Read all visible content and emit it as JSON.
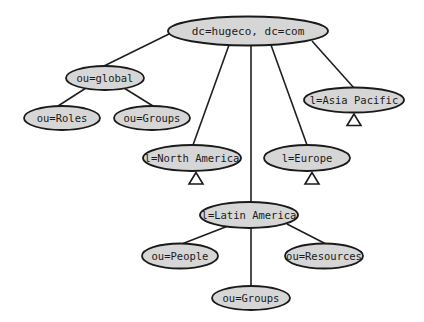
{
  "diagram": {
    "colors": {
      "node_fill": "#d6d6d6",
      "node_stroke": "#1a1a1a",
      "edge": "#1f1f1f",
      "background": "#ffffff"
    },
    "nodes": {
      "root": {
        "label": "dc=hugeco, dc=com",
        "cx": 248,
        "cy": 31,
        "rx": 80,
        "ry": 14.5
      },
      "global": {
        "label": "ou=global",
        "cx": 105,
        "cy": 78,
        "rx": 39,
        "ry": 12
      },
      "roles": {
        "label": "ou=Roles",
        "cx": 62,
        "cy": 118,
        "rx": 38,
        "ry": 12
      },
      "global_groups": {
        "label": "ou=Groups",
        "cx": 152,
        "cy": 118,
        "rx": 38,
        "ry": 12
      },
      "north_america": {
        "label": "l=North America",
        "cx": 192,
        "cy": 158,
        "rx": 49,
        "ry": 13
      },
      "europe": {
        "label": "l=Europe",
        "cx": 307,
        "cy": 158,
        "rx": 43,
        "ry": 13
      },
      "asia_pacific": {
        "label": "l=Asia Pacific",
        "cx": 354,
        "cy": 100,
        "rx": 50,
        "ry": 12.5
      },
      "latin_america": {
        "label": "l=Latin America",
        "cx": 249,
        "cy": 215,
        "rx": 49,
        "ry": 13
      },
      "people": {
        "label": "ou=People",
        "cx": 180,
        "cy": 256,
        "rx": 38,
        "ry": 12.5
      },
      "resources": {
        "label": "ou=Resources",
        "cx": 324,
        "cy": 256,
        "rx": 39,
        "ry": 12.5
      },
      "la_groups": {
        "label": "ou=Groups",
        "cx": 251,
        "cy": 298,
        "rx": 39,
        "ry": 12
      }
    },
    "edges": [
      {
        "from": "root",
        "to": "global"
      },
      {
        "from": "root",
        "to": "north_america"
      },
      {
        "from": "root",
        "to": "latin_america"
      },
      {
        "from": "root",
        "to": "europe"
      },
      {
        "from": "root",
        "to": "asia_pacific"
      },
      {
        "from": "global",
        "to": "roles"
      },
      {
        "from": "global",
        "to": "global_groups"
      },
      {
        "from": "latin_america",
        "to": "people"
      },
      {
        "from": "latin_america",
        "to": "resources"
      },
      {
        "from": "latin_america",
        "to": "la_groups"
      }
    ],
    "collapsed_subtrees": [
      "north_america",
      "europe",
      "asia_pacific"
    ]
  }
}
